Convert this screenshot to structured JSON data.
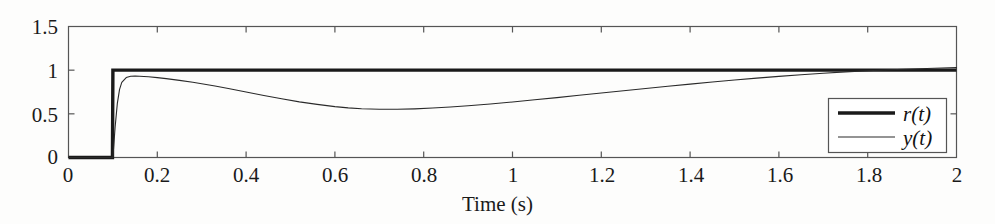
{
  "chart_data": {
    "type": "line",
    "title": "",
    "xlabel": "Time (s)",
    "ylabel": "",
    "xlim": [
      0,
      2
    ],
    "ylim": [
      0,
      1.5
    ],
    "xticks": [
      "0",
      "0.2",
      "0.4",
      "0.6",
      "0.8",
      "1",
      "1.2",
      "1.4",
      "1.6",
      "1.8",
      "2"
    ],
    "xtick_values": [
      0,
      0.2,
      0.4,
      0.6,
      0.8,
      1,
      1.2,
      1.4,
      1.6,
      1.8,
      2
    ],
    "yticks": [
      "0",
      "0.5",
      "1",
      "1.5"
    ],
    "ytick_values": [
      0,
      0.5,
      1,
      1.5
    ],
    "grid": false,
    "legend_position": "bottom-right",
    "series": [
      {
        "name": "r(t)",
        "style": "thick",
        "color": "#1a1a1a",
        "width": 3.4,
        "x": [
          0,
          0.02,
          0.04,
          0.06,
          0.08,
          0.099,
          0.1,
          0.12,
          0.2,
          0.4,
          0.6,
          0.8,
          1.0,
          1.2,
          1.4,
          1.6,
          1.8,
          2.0
        ],
        "values": [
          0,
          0,
          0,
          0,
          0,
          0,
          1,
          1,
          1,
          1,
          1,
          1,
          1,
          1,
          1,
          1,
          1,
          1
        ]
      },
      {
        "name": "y(t)",
        "style": "thin",
        "color": "#2a2a2a",
        "width": 1.1,
        "x": [
          0,
          0.02,
          0.04,
          0.06,
          0.08,
          0.1,
          0.105,
          0.11,
          0.115,
          0.12,
          0.13,
          0.14,
          0.15,
          0.16,
          0.18,
          0.2,
          0.22,
          0.25,
          0.28,
          0.3,
          0.33,
          0.36,
          0.4,
          0.44,
          0.48,
          0.52,
          0.56,
          0.6,
          0.63,
          0.66,
          0.7,
          0.74,
          0.78,
          0.82,
          0.86,
          0.9,
          0.95,
          1.0,
          1.05,
          1.1,
          1.15,
          1.2,
          1.25,
          1.3,
          1.35,
          1.4,
          1.45,
          1.5,
          1.55,
          1.6,
          1.65,
          1.7,
          1.75,
          1.8,
          1.85,
          1.9,
          1.95,
          2.0
        ],
        "values": [
          0,
          0,
          0,
          0,
          0,
          0,
          0.35,
          0.62,
          0.78,
          0.86,
          0.915,
          0.93,
          0.932,
          0.93,
          0.925,
          0.915,
          0.903,
          0.883,
          0.861,
          0.845,
          0.818,
          0.79,
          0.75,
          0.71,
          0.672,
          0.637,
          0.608,
          0.583,
          0.568,
          0.558,
          0.552,
          0.552,
          0.557,
          0.566,
          0.578,
          0.592,
          0.613,
          0.636,
          0.661,
          0.686,
          0.712,
          0.738,
          0.764,
          0.79,
          0.815,
          0.84,
          0.864,
          0.887,
          0.909,
          0.929,
          0.948,
          0.965,
          0.98,
          0.993,
          1.005,
          1.014,
          1.022,
          1.029
        ]
      }
    ],
    "legend": [
      {
        "label": "r(t)",
        "style": "thick"
      },
      {
        "label": "y(t)",
        "style": "thin"
      }
    ]
  },
  "axes": {
    "tick_color": "#4d4d4d",
    "frame_color": "#4d4d4d",
    "label_color": "#1a1a1a"
  }
}
